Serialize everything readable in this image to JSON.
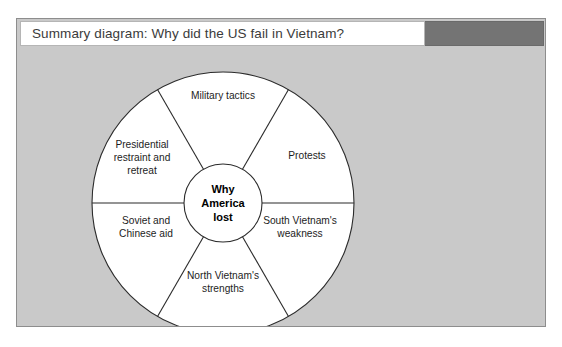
{
  "panel": {
    "title": "Summary diagram: Why did the US fail in Vietnam?",
    "accent_color": "#747474",
    "background_color": "#c9c9c9"
  },
  "wheel": {
    "hub": {
      "lines": [
        "Why",
        "America",
        "lost"
      ]
    },
    "segments": [
      {
        "name": "military-tactics",
        "lines": [
          "Military tactics"
        ]
      },
      {
        "name": "protests",
        "lines": [
          "Protests"
        ]
      },
      {
        "name": "south-vietnam-weakness",
        "lines": [
          "South Vietnam's",
          "weakness"
        ]
      },
      {
        "name": "north-vietnam-strengths",
        "lines": [
          "North Vietnam's",
          "strengths"
        ]
      },
      {
        "name": "soviet-chinese-aid",
        "lines": [
          "Soviet and",
          "Chinese aid"
        ]
      },
      {
        "name": "presidential-restraint",
        "lines": [
          "Presidential",
          "restraint and",
          "retreat"
        ]
      }
    ]
  }
}
